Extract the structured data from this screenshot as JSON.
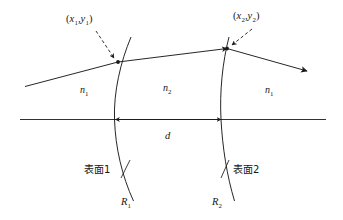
{
  "figure": {
    "type": "optical-ray-diagram",
    "background_color": "#ffffff",
    "stroke_color": "#1a1a1a"
  },
  "labels": {
    "point1": {
      "open": "(",
      "x": "x",
      "xsub": "1",
      "comma": ",",
      "y": "y",
      "ysub": "1",
      "close": ")"
    },
    "point2": {
      "open": "(",
      "x": "x",
      "xsub": "2",
      "comma": ",",
      "y": "y",
      "ysub": "2",
      "close": ")"
    },
    "index_left": {
      "symbol": "n",
      "sub": "1"
    },
    "index_middle": {
      "symbol": "n",
      "sub": "2"
    },
    "index_right": {
      "symbol": "n",
      "sub": "1"
    },
    "thickness": {
      "symbol": "d"
    },
    "surface1": {
      "text": "表面1"
    },
    "surface2": {
      "text": "表面2"
    },
    "radius1": {
      "symbol": "R",
      "sub": "1"
    },
    "radius2": {
      "symbol": "R",
      "sub": "2"
    }
  },
  "geometry": {
    "optical_axis": {
      "x_start": 20,
      "x_end": 326,
      "y": 119
    },
    "surface1_vertex": {
      "x": 115,
      "y": 119
    },
    "surface2_vertex": {
      "x": 222,
      "y": 119
    },
    "hit_point1": {
      "x": 118,
      "y": 62
    },
    "hit_point2": {
      "x": 227,
      "y": 48
    },
    "ray_in_start": {
      "x": 25,
      "y": 86
    },
    "ray_out_end": {
      "x": 307,
      "y": 71
    },
    "thickness_arrow": {
      "x_left": 115,
      "x_right": 222,
      "y": 119
    }
  }
}
